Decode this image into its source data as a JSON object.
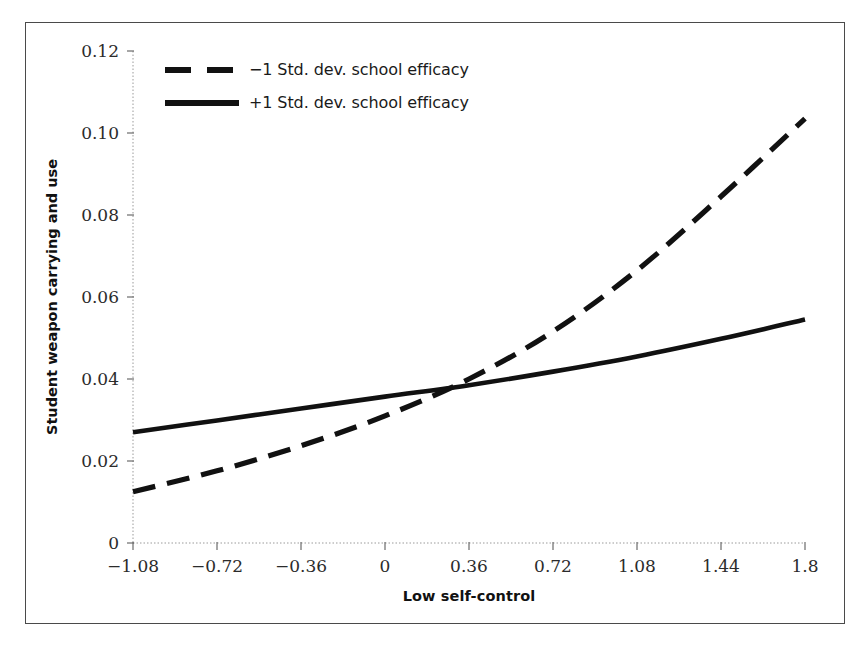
{
  "figure": {
    "background_color": "#ffffff",
    "frame_color": "#4a4a4a",
    "line_color": "#111111"
  },
  "axes": {
    "x_title": "Low self-control",
    "y_title": "Student weapon carrying and use",
    "x_ticks": [
      "−1.08",
      "−0.72",
      "−0.36",
      "0",
      "0.36",
      "0.72",
      "1.08",
      "1.44",
      "1.8"
    ],
    "y_ticks": [
      "0",
      "0.02",
      "0.04",
      "0.06",
      "0.08",
      "0.10",
      "0.12"
    ]
  },
  "legend": {
    "entries": [
      {
        "label": "−1 Std. dev. school efficacy",
        "style": "dashed"
      },
      {
        "label": "+1 Std. dev. school efficacy",
        "style": "solid"
      }
    ]
  },
  "chart_data": {
    "type": "line",
    "title": "",
    "subtitle": "",
    "xlabel": "Low self-control",
    "ylabel": "Student weapon carrying and use",
    "xlim": [
      -1.08,
      1.8
    ],
    "ylim": [
      0,
      0.12
    ],
    "xticks": [
      -1.08,
      -0.72,
      -0.36,
      0,
      0.36,
      0.72,
      1.08,
      1.44,
      1.8
    ],
    "yticks": [
      0,
      0.02,
      0.04,
      0.06,
      0.08,
      0.1,
      0.12
    ],
    "grid": false,
    "legend_position": "upper left",
    "x": [
      -1.08,
      -0.72,
      -0.36,
      0,
      0.36,
      0.72,
      1.08,
      1.44,
      1.8
    ],
    "series": [
      {
        "name": "−1 Std. dev. school efficacy",
        "style": "dashed",
        "color": "#111111",
        "values": [
          0.0125,
          0.0176,
          0.0237,
          0.031,
          0.04,
          0.0516,
          0.0665,
          0.0845,
          0.1035
        ]
      },
      {
        "name": "+1 Std. dev. school efficacy",
        "style": "solid",
        "color": "#111111",
        "values": [
          0.027,
          0.0299,
          0.0328,
          0.0357,
          0.0385,
          0.0418,
          0.0455,
          0.0498,
          0.0545
        ]
      }
    ],
    "annotations": [
      {
        "text": "curves cross",
        "x": 0.53,
        "y": 0.0385
      }
    ]
  }
}
